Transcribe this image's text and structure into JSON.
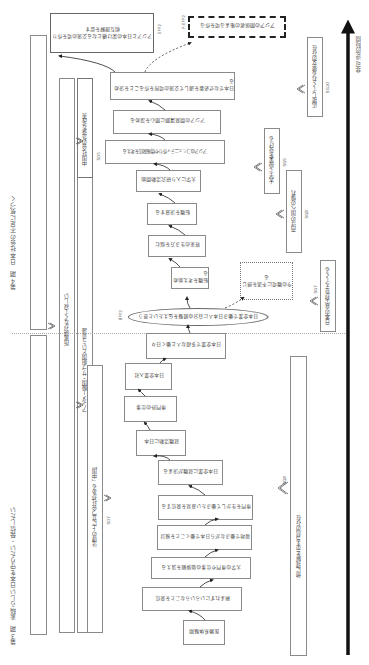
{
  "figure": {
    "orientation": "rotated 90deg counter-clockwise; time axis runs bottom-to-top",
    "time_axis": {
      "label": "非可逆的時間"
    },
    "phases": [
      {
        "id": "phase3",
        "label": "第３期　素晴らしい日本を守りたい・発信したい"
      },
      {
        "id": "phase4",
        "label": "第４期　日本社会の不足に気づく"
      }
    ],
    "social_guidance_bars": [
      {
        "id": "SD1",
        "code": "SD1",
        "label": "所属感がなくて寂しい"
      },
      {
        "id": "SD6",
        "code": "SD6",
        "label": "アンダー級国・サブ組国という意識"
      },
      {
        "id": "SD7",
        "code": "SD7",
        "label": "法律の上に立つ会社がある「中国」"
      },
      {
        "id": "SD5",
        "code": "SD5",
        "label": "中国社会の急速な改善"
      }
    ],
    "social_direction_right": [
      {
        "id": "SG8",
        "code": "SG8",
        "label": "他に理解を示す当局の存在"
      },
      {
        "id": "SG7",
        "code": "SG7",
        "label": "日本の真実が見えてくる"
      },
      {
        "id": "SG8b",
        "code": "SG8",
        "label": "西洋の国への憧れ"
      },
      {
        "id": "SG9",
        "code": "SG9",
        "label": "大学で授業を受ける"
      },
      {
        "id": "SG10",
        "code": "SG10",
        "label": "応援してくれる彼女の存在"
      }
    ],
    "flow_boxes": [
      {
        "id": "b1",
        "label": "医療系体験期"
      },
      {
        "id": "b2",
        "label": "頼まれずにいろいろなことを発信"
      },
      {
        "id": "b3",
        "label": "大学の専門や仕事の価値観を訴える"
      },
      {
        "id": "b4",
        "label": "現地で働きながら日本で働くことを検討"
      },
      {
        "id": "b5",
        "label": "専門を生かして働きたい意見を発信する"
      },
      {
        "id": "b6",
        "label": "日本企業に就職が決まる"
      },
      {
        "id": "b7",
        "label": "就職活動に日本"
      },
      {
        "id": "b8",
        "label": "専門外の仕事"
      },
      {
        "id": "b9",
        "label": "日本企業入社"
      },
      {
        "id": "b10",
        "label": "日本企業で多様な人と働く日々"
      },
      {
        "id": "b11",
        "label": "転職を考え始める"
      },
      {
        "id": "b12",
        "label": "将来の生き方を悩む"
      },
      {
        "id": "b13",
        "label": "転職を決意する"
      },
      {
        "id": "b14",
        "label": "大学に入り研究活動開始"
      },
      {
        "id": "b15",
        "label": "アジアのコミュニティ作りや情報発信を考える"
      },
      {
        "id": "b16",
        "label": "アジアの開発課題に関心を深める"
      },
      {
        "id": "b17",
        "label": "日本でなぜ必要を通して交流の場所を作ることを決める"
      }
    ],
    "bifurcation": {
      "code": "BFP2",
      "label": "日本企業で働き日本人に自分の経験を伝えたいと思う"
    },
    "dotted_note": {
      "label": "今の職場に不満を感じる"
    },
    "pefp2": {
      "code": "P-EFP2",
      "label": "アジアの関係者の集まる場を作る"
    },
    "efp2": {
      "code": "EFP2",
      "label": "アジアと日本の架け橋となる交流の場を作り相互理解を促す"
    },
    "colors": {
      "line": "#222222",
      "box_border": "#8a8a8a",
      "text": "#444444",
      "background": "#ffffff"
    }
  }
}
